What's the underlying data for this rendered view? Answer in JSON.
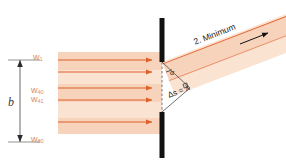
{
  "figure": {
    "background": "#ffffff",
    "width": 286,
    "height": 166
  },
  "colors": {
    "beam_fill_light": "#fbe3d2",
    "beam_fill_mid": "#f7d3bb",
    "beam_fill_dark": "#f2c3a4",
    "ray_line": "#e0602a",
    "ray_line_soft": "#e8815a",
    "label_orange": "#d98f63",
    "barrier": "#111111",
    "dimension": "#3a3a3a",
    "annotation_text": "#1b1b1b"
  },
  "labels": {
    "wavefront_top": {
      "base": "w",
      "sub": "1"
    },
    "wavefront_mid_a": {
      "base": "w",
      "sub": "40"
    },
    "wavefront_mid_b": {
      "base": "w",
      "sub": "41"
    },
    "wavefront_bottom": {
      "base": "w",
      "sub": "80"
    },
    "slit_width": "b",
    "minimum_order": "2. Minimum",
    "path_difference": "Δs = λ",
    "angle": "α"
  },
  "geometry": {
    "slit": {
      "x": 162,
      "gap_top": 62,
      "gap_bottom": 112
    },
    "barrier_top_segment": [
      18,
      62
    ],
    "barrier_bottom_segment": [
      112,
      158
    ],
    "incoming_ray_y": [
      60,
      72,
      88,
      100,
      122
    ],
    "diffraction_angle_deg": 21,
    "dimension_line_x": 20,
    "dimension_line_from_y": 60,
    "dimension_line_to_y": 142
  },
  "annotations": {
    "arrow_direction": "up-right",
    "incoming_direction": "left-to-right",
    "path_difference_value": "one wavelength"
  }
}
